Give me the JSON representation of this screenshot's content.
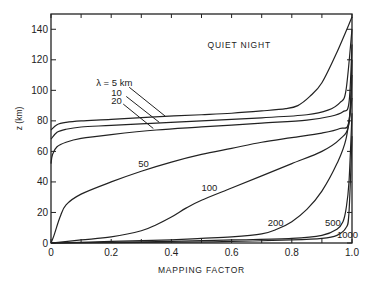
{
  "chart_data": {
    "type": "line",
    "title": "QUIET NIGHT",
    "xlabel": "MAPPING FACTOR",
    "ylabel": "z (km)",
    "xlim": [
      0,
      1.0
    ],
    "ylim": [
      0,
      150
    ],
    "xticks": [
      "0",
      "0.2",
      "0.4",
      "0.6",
      "0.8",
      "1.0"
    ],
    "yticks": [
      "0",
      "20",
      "40",
      "60",
      "80",
      "100",
      "120",
      "140"
    ],
    "grid": false,
    "series": [
      {
        "name": "λ = 5 km",
        "label": "λ = 5 km",
        "x": [
          0,
          0.02,
          0.05,
          0.1,
          0.2,
          0.33,
          0.5,
          0.6,
          0.7,
          0.78,
          0.82,
          0.86,
          0.9,
          0.95,
          1.0
        ],
        "y": [
          74,
          77.5,
          79,
          80,
          81,
          82.5,
          84,
          85,
          86.5,
          88,
          90,
          96,
          105,
          125,
          148
        ]
      },
      {
        "name": "λ = 10 km",
        "label": "10",
        "x": [
          0,
          0.02,
          0.05,
          0.1,
          0.2,
          0.35,
          0.5,
          0.7,
          0.85,
          0.92,
          0.96,
          0.98,
          1.0
        ],
        "y": [
          68,
          72.5,
          74.5,
          76,
          77,
          78.5,
          80,
          82,
          84,
          87,
          92,
          100,
          140
        ]
      },
      {
        "name": "λ = 20 km",
        "label": "20",
        "x": [
          0,
          0.005,
          0.02,
          0.05,
          0.1,
          0.2,
          0.35,
          0.5,
          0.7,
          0.85,
          0.93,
          0.97,
          0.99,
          1.0
        ],
        "y": [
          52,
          58,
          63,
          66,
          68.5,
          71,
          74,
          76,
          78.5,
          80.5,
          83,
          86,
          92,
          130
        ]
      },
      {
        "name": "λ = 50 km",
        "label": "50",
        "x": [
          0,
          0.01,
          0.03,
          0.05,
          0.1,
          0.2,
          0.3,
          0.4,
          0.5,
          0.6,
          0.7,
          0.8,
          0.9,
          0.96,
          0.99,
          1.0
        ],
        "y": [
          0,
          5,
          17,
          25,
          32,
          40,
          47,
          53,
          58,
          62,
          66,
          69,
          72,
          75,
          80,
          120
        ]
      },
      {
        "name": "λ = 100 km",
        "label": "100",
        "x": [
          0,
          0.1,
          0.2,
          0.3,
          0.35,
          0.4,
          0.45,
          0.5,
          0.6,
          0.7,
          0.8,
          0.9,
          0.96,
          0.99,
          1.0
        ],
        "y": [
          0,
          2,
          4,
          8,
          12,
          17,
          23,
          28,
          36,
          44,
          52,
          60,
          68,
          78,
          110
        ]
      },
      {
        "name": "λ = 200 km",
        "label": "200",
        "x": [
          0,
          0.2,
          0.4,
          0.5,
          0.6,
          0.7,
          0.75,
          0.8,
          0.85,
          0.9,
          0.95,
          0.98,
          1.0
        ],
        "y": [
          0,
          1,
          2,
          3,
          4,
          6,
          9,
          14,
          22,
          34,
          52,
          68,
          95
        ]
      },
      {
        "name": "λ = 500 km",
        "label": "500",
        "x": [
          0,
          0.4,
          0.6,
          0.8,
          0.9,
          0.95,
          0.97,
          0.98,
          0.99,
          1.0
        ],
        "y": [
          0,
          1,
          2,
          3,
          5,
          9,
          14,
          22,
          40,
          85
        ]
      },
      {
        "name": "λ = 1000 km",
        "label": "1000",
        "x": [
          0,
          0.4,
          0.6,
          0.8,
          0.9,
          0.95,
          0.98,
          0.99,
          1.0
        ],
        "y": [
          0,
          0.5,
          1,
          2,
          3,
          5,
          10,
          20,
          70
        ]
      }
    ],
    "annotations": [
      {
        "text": "QUIET NIGHT",
        "x": 0.52,
        "y": 128
      },
      {
        "text": "λ = 5 km",
        "x": 0.15,
        "y": 103
      },
      {
        "text": "10",
        "x": 0.2,
        "y": 96
      },
      {
        "text": "20",
        "x": 0.2,
        "y": 91
      },
      {
        "text": "50",
        "x": 0.29,
        "y": 50
      },
      {
        "text": "100",
        "x": 0.5,
        "y": 34
      },
      {
        "text": "200",
        "x": 0.72,
        "y": 11
      },
      {
        "text": "500",
        "x": 0.91,
        "y": 11
      },
      {
        "text": "1000",
        "x": 0.95,
        "y": 3
      }
    ]
  }
}
